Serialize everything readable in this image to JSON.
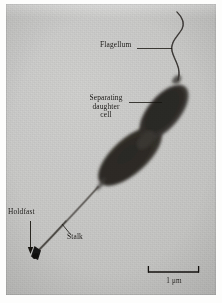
{
  "figure": {
    "kind": "electron-micrograph",
    "background_color": "#c8c8c6",
    "cell_color": "#34312e",
    "ink_color": "#14120f"
  },
  "labels": {
    "flagellum": "Flagellum",
    "separating_daughter_cell": "Separating\ndaughter\ncell",
    "separating_daughter_cell_line1": "Separating",
    "separating_daughter_cell_line2": "daughter",
    "separating_daughter_cell_line3": "cell",
    "holdfast": "Holdfast",
    "stalk": "Stalk"
  },
  "scale_bar": {
    "label": "1 μm",
    "value": 1,
    "unit": "μm",
    "length_px": 51,
    "tick_style": "down-serifs"
  },
  "annotations": {
    "flagellum_leader": "horizontal leader line from label to flagellum",
    "daughter_leader": "horizontal leader line from label to upper cell body",
    "holdfast_leader": "vertical arrow pointing down to holdfast",
    "stalk_leader": "short diagonal leader line up-left to stalk"
  }
}
